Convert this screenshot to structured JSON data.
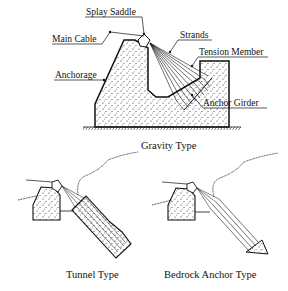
{
  "diagram": {
    "gravity": {
      "caption": "Gravity Type",
      "labels": {
        "splay_saddle": "Splay Saddle",
        "main_cable": "Main Cable",
        "strands": "Strands",
        "tension_member": "Tension Member",
        "anchorage": "Anchorage",
        "anchor_girder": "Anchor Girder"
      }
    },
    "tunnel": {
      "caption": "Tunnel Type"
    },
    "bedrock": {
      "caption": "Bedrock Anchor Type"
    },
    "colors": {
      "line": "#111111",
      "background": "#ffffff"
    }
  }
}
